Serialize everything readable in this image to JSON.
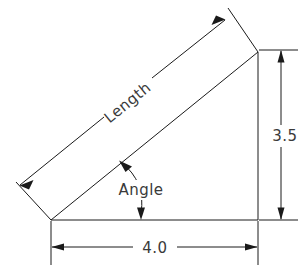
{
  "drawing": {
    "title": "Right triangle dimensioned engineering sketch",
    "background_color": "#ffffff",
    "line_color": "#1a1a1a",
    "text_color": "#3a3a3a",
    "labels": {
      "length": "Length",
      "angle": "Angle",
      "height_dimension": "3.5",
      "base_dimension": "4.0"
    },
    "dimensions": [
      {
        "name": "base",
        "value": "4.0",
        "orientation": "horizontal",
        "position": "bottom"
      },
      {
        "name": "height",
        "value": "3.5",
        "orientation": "vertical",
        "position": "right"
      },
      {
        "name": "hypotenuse",
        "value": "Length",
        "orientation": "diagonal",
        "position": "upper-left"
      },
      {
        "name": "interior-angle",
        "value": "Angle",
        "orientation": "arc",
        "position": "lower-left-vertex"
      }
    ],
    "geometry": {
      "vertices": {
        "bottom_left": [
          51,
          220
        ],
        "bottom_right": [
          258,
          220
        ],
        "top_right": [
          258,
          52
        ]
      },
      "shape": "right-triangle"
    }
  }
}
